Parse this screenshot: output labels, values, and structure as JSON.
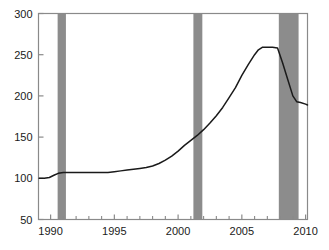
{
  "chart_data": {
    "type": "line",
    "title": "",
    "subtitle": "",
    "xlabel": "",
    "ylabel": "",
    "xlim": [
      1989.05,
      2010.15
    ],
    "ylim": [
      50,
      300
    ],
    "grid": false,
    "legend": null,
    "legend_position": "none",
    "x_ticks_major": [
      1990,
      1995,
      2000,
      2005,
      2010
    ],
    "x_tick_labels": [
      "1990",
      "1995",
      "2000",
      "2005",
      "2010"
    ],
    "x_ticks_minor": [
      1991,
      1992,
      1993,
      1994,
      1996,
      1997,
      1998,
      1999,
      2001,
      2002,
      2003,
      2004,
      2006,
      2007,
      2008,
      2009
    ],
    "y_ticks": [
      50,
      100,
      150,
      200,
      250,
      300
    ],
    "y_tick_labels": [
      "50",
      "100",
      "150",
      "200",
      "250",
      "300"
    ],
    "series": [
      {
        "name": "index",
        "color": "#1a1a1a",
        "x": [
          1989.1,
          1989.5,
          1989.9,
          1990.3,
          1990.6,
          1991.0,
          1991.5,
          1992.0,
          1992.5,
          1993.0,
          1993.5,
          1994.0,
          1994.5,
          1995.0,
          1995.5,
          1996.0,
          1996.5,
          1997.0,
          1997.5,
          1998.0,
          1998.5,
          1999.0,
          1999.5,
          2000.0,
          2000.5,
          2001.0,
          2001.5,
          2002.0,
          2002.5,
          2003.0,
          2003.5,
          2004.0,
          2004.5,
          2005.0,
          2005.5,
          2006.0,
          2006.3,
          2006.6,
          2007.0,
          2007.4,
          2007.8,
          2008.2,
          2008.6,
          2009.0,
          2009.3,
          2009.6,
          2010.0,
          2010.15
        ],
        "y": [
          100,
          100,
          101,
          104,
          106,
          107,
          107,
          107,
          107,
          107,
          107,
          107,
          107,
          108,
          109,
          110,
          111,
          112,
          113,
          115,
          118,
          122,
          127,
          133,
          140,
          146,
          152,
          159,
          167,
          176,
          186,
          198,
          210,
          225,
          238,
          250,
          256,
          259,
          259,
          259,
          258,
          240,
          220,
          200,
          193,
          192,
          190,
          189
        ]
      }
    ],
    "shaded_bands": [
      {
        "name": "recession-1990-1991",
        "x0": 1990.55,
        "x1": 1991.2,
        "color": "#8c8c8c"
      },
      {
        "name": "recession-2001",
        "x0": 2001.2,
        "x1": 2001.9,
        "color": "#8c8c8c"
      },
      {
        "name": "recession-2007-2009",
        "x0": 2007.9,
        "x1": 2009.45,
        "color": "#8c8c8c"
      }
    ],
    "frame_color": "#8a8a8a",
    "line_color": "#1a1a1a",
    "background_color": "#ffffff"
  }
}
